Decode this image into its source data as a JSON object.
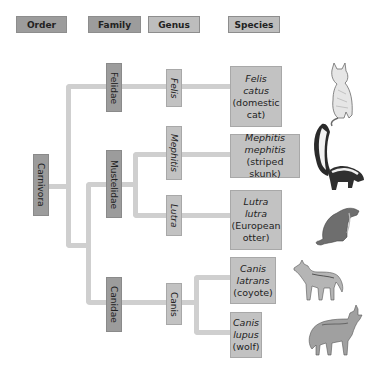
{
  "header": {
    "order": "Order",
    "family": "Family",
    "genus": "Genus",
    "species": "Species"
  },
  "order": {
    "label": "Carnivora"
  },
  "families": [
    {
      "label": "Felidae"
    },
    {
      "label": "Mustelidae"
    },
    {
      "label": "Canidae"
    }
  ],
  "genera": [
    {
      "label": "Felis"
    },
    {
      "label": "Mephitis"
    },
    {
      "label": "Lutra"
    },
    {
      "label": "Canis"
    }
  ],
  "species": [
    {
      "line1": "Felis",
      "line2": "catus",
      "common": "(domestic cat)",
      "common_a": "(domestic",
      "common_b": "cat)",
      "animal": "cat"
    },
    {
      "line1": "Mephitis",
      "line2": "mephitis",
      "common": "(striped skunk)",
      "animal": "skunk"
    },
    {
      "line1": "Lutra",
      "line2": "lutra",
      "common": "(European otter)",
      "common_a": "(European",
      "common_b": "otter)",
      "animal": "otter"
    },
    {
      "line1": "Canis",
      "line2": "latrans",
      "common": "(coyote)",
      "animal": "coyote"
    },
    {
      "line1": "Canis",
      "line2": "lupus",
      "common": "(wolf)",
      "animal": "wolf"
    }
  ],
  "colors": {
    "rank_dark": "#9c9c9c",
    "rank_light": "#c2c2c2",
    "connector": "#cfcfcf"
  }
}
